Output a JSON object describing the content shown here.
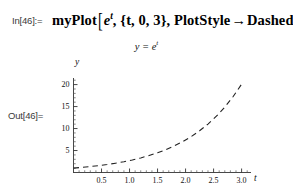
{
  "notebook": {
    "in_label": "In[46]:=",
    "out_label": "Out[46]=",
    "input": {
      "function_name": "myPlot",
      "open_bracket": "[",
      "arg1_base": "e",
      "arg1_exponent": "t",
      "comma1": ", ",
      "arg2": "{t, 0, 3}",
      "comma2": ", ",
      "option_name": "PlotStyle",
      "arrow": "→",
      "option_value": "Dashed",
      "close_bracket": "]",
      "full_text": "myPlot[e^t, {t, 0, 3}, PlotStyle → Dashed]"
    }
  },
  "chart_data": {
    "type": "line",
    "title": "y = e",
    "title_exponent": "t",
    "xlabel": "t",
    "ylabel": "y",
    "xlim": [
      0,
      3.15
    ],
    "ylim": [
      0,
      21.5
    ],
    "xticks": [
      "0.5",
      "1.0",
      "1.5",
      "2.0",
      "2.5",
      "3.0"
    ],
    "xtick_values": [
      0.5,
      1.0,
      1.5,
      2.0,
      2.5,
      3.0
    ],
    "yticks": [
      "5",
      "10",
      "15",
      "20"
    ],
    "ytick_values": [
      5,
      10,
      15,
      20
    ],
    "grid": false,
    "legend": false,
    "line_style": "dashed",
    "line_color": "#222222",
    "series": [
      {
        "name": "y = e^t",
        "expression": "E^t",
        "x": [
          0,
          0.15,
          0.3,
          0.45,
          0.6,
          0.75,
          0.9,
          1.05,
          1.2,
          1.35,
          1.5,
          1.65,
          1.8,
          1.95,
          2.1,
          2.25,
          2.4,
          2.55,
          2.7,
          2.85,
          3.0
        ],
        "values": [
          1.0,
          1.16,
          1.35,
          1.57,
          1.82,
          2.12,
          2.46,
          2.86,
          3.32,
          3.86,
          4.48,
          5.21,
          6.05,
          7.03,
          8.17,
          9.49,
          11.02,
          12.81,
          14.88,
          17.29,
          20.09
        ]
      }
    ]
  }
}
